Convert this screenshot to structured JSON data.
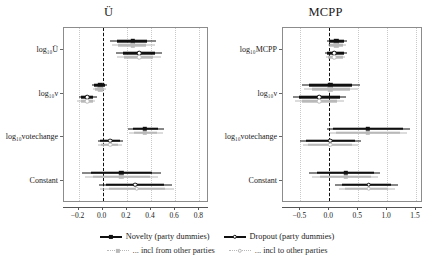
{
  "figure": {
    "width": 434,
    "height": 273,
    "colors": {
      "dark": "#101010",
      "light": "#b9b9b9",
      "frame": "#8c8c8c",
      "grid": "#c9c9c9"
    }
  },
  "chart_data": {
    "type": "scatter",
    "title": "",
    "xlabel": "",
    "ylabel": "",
    "grid": true,
    "legend_position": "bottom",
    "panels": [
      {
        "title": "Ü",
        "xlim": [
          -0.32,
          0.88
        ],
        "xticks": [
          -0.2,
          0.0,
          0.2,
          0.4,
          0.6,
          0.8
        ],
        "xtick_labels": [
          "−0.2",
          "0.0",
          "0.2",
          "0.4",
          "0.6",
          "0.8"
        ],
        "zero_reference": 0.0,
        "categories": [
          "log10U",
          "log10nu",
          "log10votechange",
          "Constant"
        ],
        "category_labels": [
          "log₁₀Ü",
          "log₁₀ν",
          "log₁₀votechange",
          "Constant"
        ],
        "rows": [
          {
            "category": "log₁₀Ü",
            "estimates": [
              {
                "series": "Novelty (party dummies)",
                "style": "solid-dark",
                "value": 0.25,
                "ci_inner": [
                  0.12,
                  0.37
                ],
                "ci_outer": [
                  0.06,
                  0.44
                ]
              },
              {
                "series": "... incl from other parties",
                "style": "solid-light",
                "value": 0.25,
                "ci_inner": [
                  0.13,
                  0.36
                ],
                "ci_outer": [
                  0.08,
                  0.43
                ]
              },
              {
                "series": "Dropout (party dummies)",
                "style": "hollow-dark",
                "value": 0.3,
                "ci_inner": [
                  0.17,
                  0.43
                ],
                "ci_outer": [
                  0.11,
                  0.49
                ]
              },
              {
                "series": "... incl to other parties",
                "style": "hollow-light",
                "value": 0.3,
                "ci_inner": [
                  0.18,
                  0.42
                ],
                "ci_outer": [
                  0.12,
                  0.48
                ]
              }
            ]
          },
          {
            "category": "log₁₀ν",
            "estimates": [
              {
                "series": "Novelty (party dummies)",
                "style": "solid-dark",
                "value": -0.02,
                "ci_inner": [
                  -0.07,
                  0.02
                ],
                "ci_outer": [
                  -0.09,
                  0.04
                ]
              },
              {
                "series": "... incl from other parties",
                "style": "solid-light",
                "value": -0.02,
                "ci_inner": [
                  -0.06,
                  0.01
                ],
                "ci_outer": [
                  -0.08,
                  0.03
                ]
              },
              {
                "series": "Dropout (party dummies)",
                "style": "hollow-dark",
                "value": -0.13,
                "ci_inner": [
                  -0.18,
                  -0.08
                ],
                "ci_outer": [
                  -0.2,
                  -0.05
                ]
              },
              {
                "series": "... incl to other parties",
                "style": "hollow-light",
                "value": -0.13,
                "ci_inner": [
                  -0.18,
                  -0.08
                ],
                "ci_outer": [
                  -0.21,
                  -0.06
                ]
              }
            ]
          },
          {
            "category": "log₁₀votechange",
            "estimates": [
              {
                "series": "Novelty (party dummies)",
                "style": "solid-dark",
                "value": 0.35,
                "ci_inner": [
                  0.25,
                  0.46
                ],
                "ci_outer": [
                  0.21,
                  0.51
                ]
              },
              {
                "series": "... incl from other parties",
                "style": "solid-light",
                "value": 0.35,
                "ci_inner": [
                  0.26,
                  0.45
                ],
                "ci_outer": [
                  0.22,
                  0.5
                ]
              },
              {
                "series": "Dropout (party dummies)",
                "style": "hollow-dark",
                "value": 0.06,
                "ci_inner": [
                  -0.02,
                  0.14
                ],
                "ci_outer": [
                  -0.04,
                  0.17
                ]
              },
              {
                "series": "... incl to other parties",
                "style": "hollow-light",
                "value": 0.06,
                "ci_inner": [
                  -0.01,
                  0.13
                ],
                "ci_outer": [
                  -0.04,
                  0.16
                ]
              }
            ]
          },
          {
            "category": "Constant",
            "estimates": [
              {
                "series": "Novelty (party dummies)",
                "style": "solid-dark",
                "value": 0.155,
                "ci_inner": [
                  -0.1,
                  0.41
                ],
                "ci_outer": [
                  -0.17,
                  0.48
                ]
              },
              {
                "series": "... incl from other parties",
                "style": "solid-light",
                "value": 0.155,
                "ci_inner": [
                  -0.08,
                  0.39
                ],
                "ci_outer": [
                  -0.15,
                  0.46
                ]
              },
              {
                "series": "Dropout (party dummies)",
                "style": "hollow-dark",
                "value": 0.27,
                "ci_inner": [
                  0.03,
                  0.51
                ],
                "ci_outer": [
                  -0.03,
                  0.57
                ]
              },
              {
                "series": "... incl to other parties",
                "style": "hollow-light",
                "value": 0.28,
                "ci_inner": [
                  0.05,
                  0.52
                ],
                "ci_outer": [
                  -0.02,
                  0.59
                ]
              }
            ]
          }
        ]
      },
      {
        "title": "MCPP",
        "xlim": [
          -0.8,
          1.62
        ],
        "xticks": [
          -0.5,
          0.0,
          0.5,
          1.0,
          1.5
        ],
        "xtick_labels": [
          "−0.5",
          "0.0",
          "0.5",
          "1.0",
          "1.5"
        ],
        "zero_reference": 0.0,
        "categories": [
          "log10MCPP",
          "log10nu",
          "log10votechange",
          "Constant"
        ],
        "category_labels": [
          "log₁₀MCPP",
          "log₁₀ν",
          "log₁₀votechange",
          "Constant"
        ],
        "rows": [
          {
            "category": "log₁₀MCPP",
            "estimates": [
              {
                "series": "Novelty (party dummies)",
                "style": "solid-dark",
                "value": 0.12,
                "ci_inner": [
                  0.0,
                  0.26
                ],
                "ci_outer": [
                  -0.04,
                  0.31
                ]
              },
              {
                "series": "... incl from other parties",
                "style": "solid-light",
                "value": 0.12,
                "ci_inner": [
                  0.02,
                  0.24
                ],
                "ci_outer": [
                  -0.02,
                  0.29
                ]
              },
              {
                "series": "Dropout (party dummies)",
                "style": "hollow-dark",
                "value": 0.09,
                "ci_inner": [
                  -0.04,
                  0.25
                ],
                "ci_outer": [
                  -0.08,
                  0.3
                ]
              },
              {
                "series": "... incl to other parties",
                "style": "hollow-light",
                "value": 0.09,
                "ci_inner": [
                  -0.02,
                  0.23
                ],
                "ci_outer": [
                  -0.06,
                  0.28
                ]
              }
            ]
          },
          {
            "category": "log₁₀ν",
            "estimates": [
              {
                "series": "Novelty (party dummies)",
                "style": "solid-dark",
                "value": 0.02,
                "ci_inner": [
                  -0.35,
                  0.4
                ],
                "ci_outer": [
                  -0.48,
                  0.53
                ]
              },
              {
                "series": "... incl from other parties",
                "style": "solid-light",
                "value": 0.02,
                "ci_inner": [
                  -0.3,
                  0.35
                ],
                "ci_outer": [
                  -0.44,
                  0.49
                ]
              },
              {
                "series": "Dropout (party dummies)",
                "style": "hollow-dark",
                "value": -0.17,
                "ci_inner": [
                  -0.52,
                  0.18
                ],
                "ci_outer": [
                  -0.63,
                  0.29
                ]
              },
              {
                "series": "... incl to other parties",
                "style": "hollow-light",
                "value": -0.17,
                "ci_inner": [
                  -0.48,
                  0.14
                ],
                "ci_outer": [
                  -0.59,
                  0.25
                ]
              }
            ]
          },
          {
            "category": "log₁₀votechange",
            "estimates": [
              {
                "series": "Novelty (party dummies)",
                "style": "solid-dark",
                "value": 0.67,
                "ci_inner": [
                  0.06,
                  1.28
                ],
                "ci_outer": [
                  -0.04,
                  1.4
                ]
              },
              {
                "series": "... incl from other parties",
                "style": "solid-light",
                "value": 0.67,
                "ci_inner": [
                  0.12,
                  1.22
                ],
                "ci_outer": [
                  0.02,
                  1.34
                ]
              },
              {
                "series": "Dropout (party dummies)",
                "style": "hollow-dark",
                "value": 0.02,
                "ci_inner": [
                  -0.41,
                  0.45
                ],
                "ci_outer": [
                  -0.5,
                  0.54
                ]
              },
              {
                "series": "... incl to other parties",
                "style": "hollow-light",
                "value": 0.02,
                "ci_inner": [
                  -0.36,
                  0.4
                ],
                "ci_outer": [
                  -0.46,
                  0.5
                ]
              }
            ]
          },
          {
            "category": "Constant",
            "estimates": [
              {
                "series": "Novelty (party dummies)",
                "style": "solid-dark",
                "value": 0.29,
                "ci_inner": [
                  -0.22,
                  0.77
                ],
                "ci_outer": [
                  -0.35,
                  0.88
                ]
              },
              {
                "series": "... incl from other parties",
                "style": "solid-light",
                "value": 0.29,
                "ci_inner": [
                  -0.16,
                  0.72
                ],
                "ci_outer": [
                  -0.3,
                  0.84
                ]
              },
              {
                "series": "Dropout (party dummies)",
                "style": "hollow-dark",
                "value": 0.68,
                "ci_inner": [
                  0.22,
                  1.06
                ],
                "ci_outer": [
                  0.1,
                  1.18
                ]
              },
              {
                "series": "... incl to other parties",
                "style": "hollow-light",
                "value": 0.68,
                "ci_inner": [
                  0.28,
                  1.02
                ],
                "ci_outer": [
                  0.16,
                  1.14
                ]
              }
            ]
          }
        ]
      }
    ],
    "legend": [
      {
        "label": "Novelty (party dummies)",
        "style": "solid-dark"
      },
      {
        "label": "Dropout (party dummies)",
        "style": "hollow-dark"
      },
      {
        "label": "... incl from other parties",
        "style": "solid-light"
      },
      {
        "label": "... incl to other parties",
        "style": "hollow-light"
      }
    ]
  }
}
